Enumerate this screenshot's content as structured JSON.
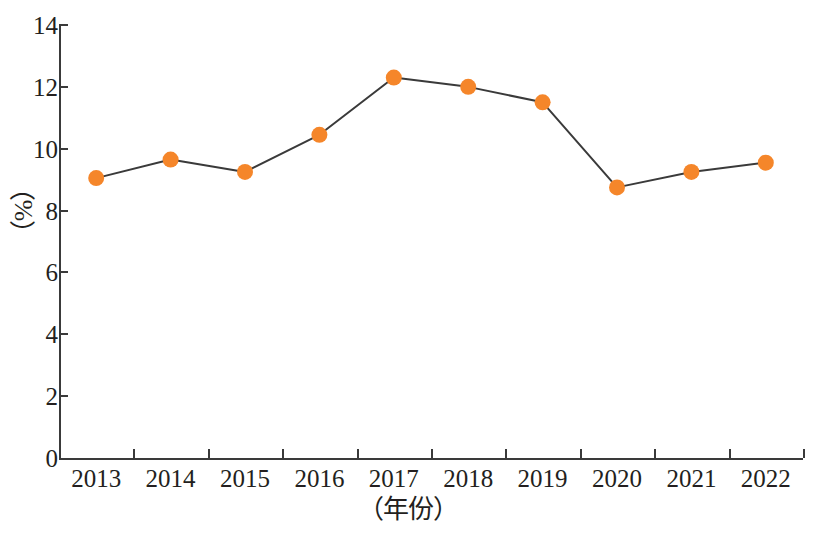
{
  "chart_data": {
    "type": "line",
    "title": "",
    "xlabel": "（年份）",
    "ylabel": "（%）",
    "categories": [
      "2013",
      "2014",
      "2015",
      "2016",
      "2017",
      "2018",
      "2019",
      "2020",
      "2021",
      "2022"
    ],
    "values": [
      9.05,
      9.65,
      9.25,
      10.45,
      12.3,
      12.0,
      11.5,
      8.75,
      9.25,
      9.55
    ],
    "series": [
      {
        "name": "",
        "values": [
          9.05,
          9.65,
          9.25,
          10.45,
          12.3,
          12.0,
          11.5,
          8.75,
          9.25,
          9.55
        ]
      }
    ],
    "ylim": [
      0,
      14
    ],
    "y_ticks": [
      "0",
      "2",
      "4",
      "6",
      "8",
      "10",
      "12",
      "14"
    ],
    "y_tick_values": [
      0,
      2,
      4,
      6,
      8,
      10,
      12,
      14
    ],
    "x_ticks": [
      "2013",
      "2014",
      "2015",
      "2016",
      "2017",
      "2018",
      "2019",
      "2020",
      "2021",
      "2022"
    ],
    "grid": false,
    "legend": "none",
    "marker_color": "#F5862A",
    "line_color": "#3A3A3A",
    "axis_color": "#3A3A3A",
    "marker_style": "filled-circle"
  },
  "axes": {
    "y_title": "（%）",
    "x_title": "（年份）"
  },
  "caption": {
    "cropped_text": ""
  }
}
